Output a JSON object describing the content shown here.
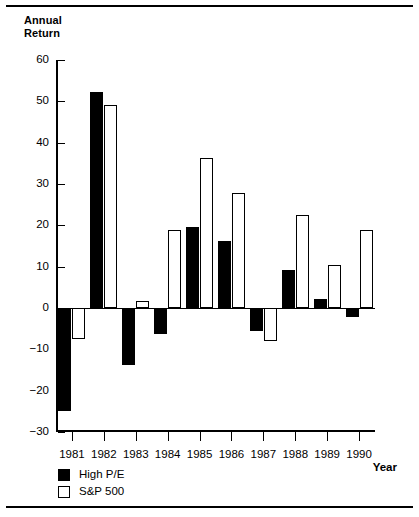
{
  "figure": {
    "axis_title_y": "Annual\nReturn",
    "axis_title_x": "Year"
  },
  "legend": {
    "items": [
      {
        "label": "High P/E",
        "style": "filled",
        "color": "#000000"
      },
      {
        "label": "S&P 500",
        "style": "hollow",
        "color": "#ffffff"
      }
    ]
  },
  "chart_data": {
    "type": "bar",
    "title": "",
    "subtitle": "",
    "xlabel": "Year",
    "ylabel": "Annual Return",
    "categories": [
      "1981",
      "1982",
      "1983",
      "1984",
      "1985",
      "1986",
      "1987",
      "1988",
      "1989",
      "1990"
    ],
    "series": [
      {
        "name": "High P/E",
        "fill": "#000000",
        "values": [
          -24.8,
          52.2,
          -13.9,
          -6.4,
          19.6,
          16.2,
          -5.6,
          9.1,
          2.1,
          -2.1
        ]
      },
      {
        "name": "S&P 500",
        "fill": "#ffffff",
        "values": [
          -7.5,
          49.0,
          1.6,
          18.8,
          36.2,
          27.8,
          -8.0,
          22.5,
          10.3,
          18.8
        ]
      }
    ],
    "ylim": [
      -30,
      60
    ],
    "yticks": [
      -30,
      -20,
      -10,
      0,
      10,
      20,
      30,
      40,
      50,
      60
    ],
    "ytick_labels": [
      "−30",
      "−20",
      "−10",
      "0",
      "10",
      "20",
      "30",
      "40",
      "50",
      "60"
    ],
    "grid": false,
    "legend_position": "bottom-left",
    "orientation": "vertical",
    "grouped": true
  }
}
